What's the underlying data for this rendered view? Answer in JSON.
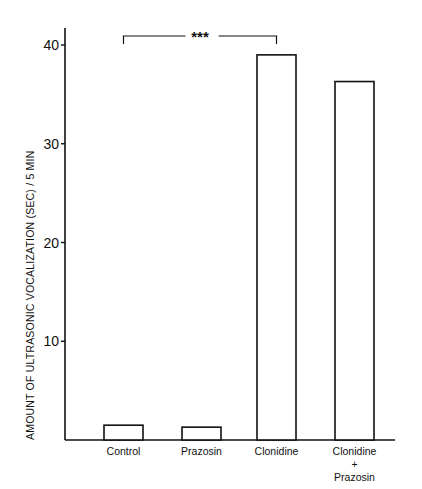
{
  "chart_data": {
    "type": "bar",
    "title": "",
    "xlabel": "",
    "ylabel": "AMOUNT OF ULTRASONIC VOCALIZATION (SEC) / 5 MIN",
    "categories": [
      "Control",
      "Prazosin",
      "Clonidine",
      "Clonidine + Prazosin"
    ],
    "category_lines": [
      [
        "Control"
      ],
      [
        "Prazosin"
      ],
      [
        "Clonidine"
      ],
      [
        "Clonidine",
        "+",
        "Prazosin"
      ]
    ],
    "values": [
      1.5,
      1.3,
      39,
      36.3
    ],
    "ylim": [
      0,
      42
    ],
    "yticks": [
      10,
      20,
      30,
      40
    ],
    "grid": false,
    "legend": null,
    "annotations": [
      {
        "type": "significance-bracket",
        "from": "Control",
        "to": "Clonidine",
        "label": "***"
      }
    ]
  }
}
